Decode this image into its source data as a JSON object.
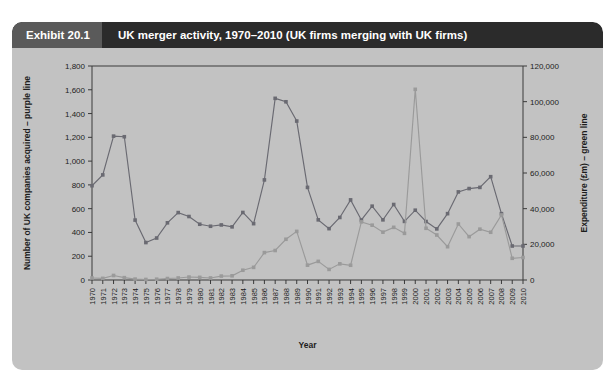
{
  "exhibit": {
    "number": "Exhibit 20.1",
    "title": "UK merger activity, 1970–2010 (UK firms merging with UK firms)"
  },
  "colors": {
    "header_bar": "#2b2b2b",
    "header_badge": "#5a5a5a",
    "card_background": "#c2c2c2",
    "purple_series": "#6a6a72",
    "green_series": "#9a9a9a",
    "axis": "#3a3a3a",
    "text": "#1c1c1c"
  },
  "chart_data": {
    "type": "line",
    "title": "UK merger activity, 1970–2010 (UK firms merging with UK firms)",
    "xlabel": "Year",
    "ylabel": "Number of UK companies acquired – purple line",
    "y2label": "Expenditure (£m) – green line",
    "grid": false,
    "legend": "inline-axis-labels",
    "ylim": [
      0,
      1800
    ],
    "y2lim": [
      0,
      120000
    ],
    "yticks": [
      0,
      200,
      400,
      600,
      800,
      1000,
      1200,
      1400,
      1600,
      1800
    ],
    "ytick_labels": [
      "0",
      "200",
      "400",
      "600",
      "800",
      "1,000",
      "1,200",
      "1,400",
      "1,600",
      "1,800"
    ],
    "y2ticks": [
      0,
      20000,
      40000,
      60000,
      80000,
      100000,
      120000
    ],
    "y2tick_labels": [
      "0",
      "20,000",
      "40,000",
      "60,000",
      "80,000",
      "100,000",
      "120,000"
    ],
    "categories": [
      "1970",
      "1971",
      "1972",
      "1973",
      "1974",
      "1975",
      "1976",
      "1977",
      "1978",
      "1979",
      "1980",
      "1981",
      "1982",
      "1983",
      "1984",
      "1985",
      "1986",
      "1987",
      "1988",
      "1989",
      "1990",
      "1991",
      "1992",
      "1993",
      "1994",
      "1995",
      "1996",
      "1997",
      "1998",
      "1999",
      "2000",
      "2001",
      "2002",
      "2003",
      "2004",
      "2005",
      "2006",
      "2007",
      "2008",
      "2009",
      "2010"
    ],
    "series": [
      {
        "name": "Number of UK companies acquired – purple line",
        "axis": "left",
        "color": "#6a6a72",
        "values": [
          793,
          884,
          1210,
          1205,
          504,
          315,
          353,
          481,
          567,
          534,
          469,
          452,
          463,
          447,
          568,
          474,
          842,
          1528,
          1499,
          1337,
          779,
          506,
          432,
          526,
          674,
          505,
          621,
          506,
          635,
          493,
          587,
          492,
          430,
          558,
          741,
          769,
          779,
          869,
          558,
          286,
          286
        ]
      },
      {
        "name": "Expenditure (£m) – green line",
        "axis": "right",
        "color": "#9a9a9a",
        "values": [
          1122,
          911,
          2532,
          1304,
          508,
          291,
          448,
          824,
          1140,
          1656,
          1475,
          1144,
          2206,
          2343,
          5474,
          7090,
          15370,
          16539,
          22839,
          27250,
          8329,
          10434,
          5941,
          9064,
          8269,
          32600,
          30742,
          26829,
          29525,
          26163,
          106916,
          28994,
          25236,
          18679,
          31408,
          24319,
          28511,
          26778,
          36469,
          12167,
          12605
        ]
      }
    ],
    "annotations": [
      {
        "year": "2000",
        "series": "Expenditure (£m) – green line",
        "note": "peak spike",
        "value": 106916
      },
      {
        "year": "1987",
        "series": "Number of UK companies acquired – purple line",
        "note": "peak",
        "value": 1528
      }
    ]
  }
}
